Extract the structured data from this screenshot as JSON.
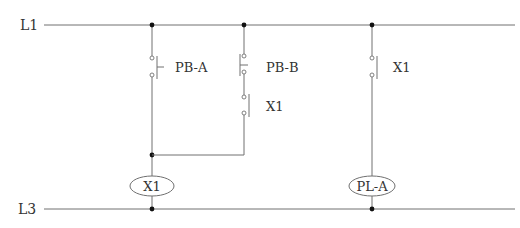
{
  "diagram": {
    "type": "ladder-logic",
    "rails": {
      "top": {
        "label": "L1"
      },
      "bottom": {
        "label": "L3"
      }
    },
    "rungs": [
      {
        "id": "rung-1",
        "elements": [
          {
            "kind": "pushbutton-no",
            "label": "PB-A"
          },
          {
            "kind": "coil",
            "label": "X1"
          }
        ]
      },
      {
        "id": "rung-1-branch",
        "elements": [
          {
            "kind": "pushbutton-no",
            "label": "PB-B"
          },
          {
            "kind": "contact-no",
            "label": "X1"
          }
        ]
      },
      {
        "id": "rung-2",
        "elements": [
          {
            "kind": "contact-no",
            "label": "X1"
          },
          {
            "kind": "pilot-lamp",
            "label": "PL-A"
          }
        ]
      }
    ],
    "colors": {
      "wire": "#707070",
      "node": "#111111",
      "text": "#333333",
      "background": "#ffffff"
    }
  }
}
